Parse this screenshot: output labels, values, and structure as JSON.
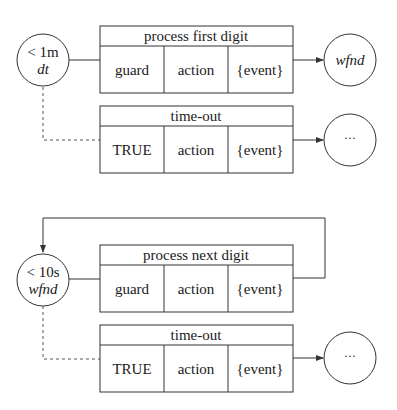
{
  "diagram": {
    "groups": [
      {
        "source_state": {
          "line1": "< 1m",
          "line2": "dt"
        },
        "transitions": [
          {
            "title": "process first digit",
            "cells": [
              "guard",
              "action",
              "{event}"
            ],
            "target": "wfnd",
            "link": "solid"
          },
          {
            "title": "time-out",
            "cells": [
              "TRUE",
              "action",
              "{event}"
            ],
            "target": "···",
            "link": "dashed"
          }
        ]
      },
      {
        "source_state": {
          "line1": "< 10s",
          "line2": "wfnd"
        },
        "transitions": [
          {
            "title": "process next digit",
            "cells": [
              "guard",
              "action",
              "{event}"
            ],
            "target": "self-loop",
            "link": "solid"
          },
          {
            "title": "time-out",
            "cells": [
              "TRUE",
              "action",
              "{event}"
            ],
            "target": "···",
            "link": "dashed"
          }
        ]
      }
    ]
  }
}
